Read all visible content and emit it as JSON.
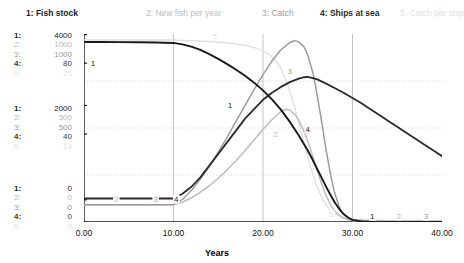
{
  "chart_data": {
    "type": "line",
    "title": "",
    "xlabel": "Years",
    "ylabel": "",
    "xlim": [
      0,
      40
    ],
    "grid": true,
    "legend_position": "top",
    "x_ticks": [
      "0.00",
      "10.00",
      "20.00",
      "30.00",
      "40.00"
    ],
    "x_tick_values": [
      0,
      10,
      20,
      30,
      40
    ],
    "axis_scales": [
      {
        "index": "1:",
        "series": "Fish stock",
        "color": "#222222",
        "top": "4000",
        "mid": "2000",
        "bottom": "0"
      },
      {
        "index": "2:",
        "series": "New fish per year",
        "color": "#b9b9b9",
        "top": "1000",
        "mid": "500",
        "bottom": "0"
      },
      {
        "index": "3:",
        "series": "Catch",
        "color": "#9a9a9a",
        "top": "1000",
        "mid": "500",
        "bottom": "0"
      },
      {
        "index": "4:",
        "series": "Ships at sea",
        "color": "#3c3c3c",
        "top": "80",
        "mid": "40",
        "bottom": "0"
      },
      {
        "index": "5:",
        "series": "Catch per ship",
        "color": "#e2e2e2",
        "top": "25",
        "mid": "14",
        "bottom": "0"
      }
    ],
    "legend": [
      {
        "label": "1: Fish stock",
        "color": "#1a1a1a"
      },
      {
        "label": "2: New fish per year",
        "color": "#bdbdbd"
      },
      {
        "label": "3: Catch",
        "color": "#9d9d9d"
      },
      {
        "label": "4: Ships at sea",
        "color": "#2b2b2b"
      },
      {
        "label": "5: Catch per ship",
        "color": "#e0e0e0"
      }
    ],
    "series": [
      {
        "name": "Fish stock",
        "tag": "1",
        "color": "#1a1a1a",
        "width": 1.9,
        "points": [
          [
            0,
            3830
          ],
          [
            2,
            3830
          ],
          [
            4,
            3828
          ],
          [
            6,
            3825
          ],
          [
            8,
            3820
          ],
          [
            10,
            3810
          ],
          [
            11,
            3780
          ],
          [
            12,
            3730
          ],
          [
            13,
            3660
          ],
          [
            14,
            3570
          ],
          [
            15,
            3470
          ],
          [
            16,
            3360
          ],
          [
            17,
            3240
          ],
          [
            18,
            3110
          ],
          [
            19,
            2965
          ],
          [
            20,
            2800
          ],
          [
            21,
            2610
          ],
          [
            22,
            2390
          ],
          [
            23,
            2130
          ],
          [
            24,
            1840
          ],
          [
            25,
            1520
          ],
          [
            25.5,
            1340
          ],
          [
            26,
            1150
          ],
          [
            26.5,
            960
          ],
          [
            27,
            770
          ],
          [
            27.5,
            590
          ],
          [
            28,
            420
          ],
          [
            28.5,
            280
          ],
          [
            29,
            170
          ],
          [
            29.5,
            95
          ],
          [
            30,
            45
          ],
          [
            31,
            12
          ],
          [
            32,
            5
          ],
          [
            34,
            3
          ],
          [
            36,
            2
          ],
          [
            38,
            2
          ],
          [
            40,
            2
          ]
        ]
      },
      {
        "name": "New fish per year",
        "tag": "2",
        "color": "#bdbdbd",
        "width": 1.5,
        "points": [
          [
            0,
            92
          ],
          [
            4,
            92
          ],
          [
            8,
            92
          ],
          [
            10,
            92
          ],
          [
            11,
            105
          ],
          [
            12,
            128
          ],
          [
            13,
            158
          ],
          [
            14,
            193
          ],
          [
            15,
            233
          ],
          [
            16,
            278
          ],
          [
            17,
            327
          ],
          [
            18,
            380
          ],
          [
            19,
            436
          ],
          [
            20,
            492
          ],
          [
            21,
            545
          ],
          [
            22,
            588
          ],
          [
            22.6,
            600
          ],
          [
            23,
            596
          ],
          [
            23.6,
            570
          ],
          [
            24,
            540
          ],
          [
            24.6,
            482
          ],
          [
            25,
            430
          ],
          [
            25.6,
            345
          ],
          [
            26,
            282
          ],
          [
            26.6,
            196
          ],
          [
            27,
            146
          ],
          [
            27.6,
            88
          ],
          [
            28,
            60
          ],
          [
            28.6,
            32
          ],
          [
            29,
            20
          ],
          [
            29.6,
            10
          ],
          [
            30,
            6
          ],
          [
            32,
            3
          ],
          [
            34,
            2
          ],
          [
            36,
            2
          ],
          [
            38,
            2
          ],
          [
            40,
            2
          ]
        ]
      },
      {
        "name": "Catch",
        "tag": "3",
        "color": "#9d9d9d",
        "width": 1.5,
        "points": [
          [
            0,
            92
          ],
          [
            4,
            92
          ],
          [
            8,
            92
          ],
          [
            10,
            92
          ],
          [
            11,
            120
          ],
          [
            12,
            168
          ],
          [
            13,
            228
          ],
          [
            14,
            296
          ],
          [
            15,
            372
          ],
          [
            16,
            452
          ],
          [
            17,
            536
          ],
          [
            18,
            620
          ],
          [
            19,
            704
          ],
          [
            20,
            784
          ],
          [
            21,
            856
          ],
          [
            22,
            916
          ],
          [
            23,
            955
          ],
          [
            23.6,
            965
          ],
          [
            24,
            958
          ],
          [
            24.6,
            930
          ],
          [
            25,
            888
          ],
          [
            25.6,
            790
          ],
          [
            26,
            690
          ],
          [
            26.6,
            520
          ],
          [
            27,
            395
          ],
          [
            27.6,
            240
          ],
          [
            28,
            155
          ],
          [
            28.6,
            72
          ],
          [
            29,
            42
          ],
          [
            29.6,
            18
          ],
          [
            30,
            10
          ],
          [
            32,
            4
          ],
          [
            34,
            3
          ],
          [
            36,
            2
          ],
          [
            38,
            2
          ],
          [
            40,
            2
          ]
        ]
      },
      {
        "name": "Ships at sea",
        "tag": "4",
        "color": "#2b2b2b",
        "width": 1.8,
        "points": [
          [
            0,
            10
          ],
          [
            4,
            10
          ],
          [
            8,
            10
          ],
          [
            10,
            10
          ],
          [
            11,
            12
          ],
          [
            12,
            15
          ],
          [
            13,
            19
          ],
          [
            14,
            24
          ],
          [
            15,
            29
          ],
          [
            16,
            34
          ],
          [
            17,
            39
          ],
          [
            18,
            44
          ],
          [
            19,
            48
          ],
          [
            20,
            52
          ],
          [
            21,
            55
          ],
          [
            22,
            57.5
          ],
          [
            23,
            59.5
          ],
          [
            24,
            61
          ],
          [
            24.6,
            61.6
          ],
          [
            25,
            61.8
          ],
          [
            26,
            60.8
          ],
          [
            27,
            59
          ],
          [
            28,
            57
          ],
          [
            29,
            55
          ],
          [
            30,
            52.8
          ],
          [
            31,
            50.5
          ],
          [
            32,
            48
          ],
          [
            33,
            45.5
          ],
          [
            34,
            43
          ],
          [
            35,
            40.5
          ],
          [
            36,
            38
          ],
          [
            37,
            35.5
          ],
          [
            38,
            33
          ],
          [
            39,
            30.5
          ],
          [
            40,
            28
          ]
        ]
      },
      {
        "name": "Catch per ship",
        "tag": "5",
        "color": "#e0e0e0",
        "width": 1.4,
        "points": [
          [
            0,
            24.2
          ],
          [
            5,
            24.2
          ],
          [
            10,
            24.2
          ],
          [
            12,
            24.1
          ],
          [
            14,
            24.0
          ],
          [
            16,
            23.8
          ],
          [
            18,
            23.5
          ],
          [
            19,
            23.2
          ],
          [
            20,
            22.8
          ],
          [
            21,
            22.0
          ],
          [
            21.6,
            21.2
          ],
          [
            22,
            20.4
          ],
          [
            22.6,
            18.8
          ],
          [
            23,
            17.4
          ],
          [
            23.6,
            15.0
          ],
          [
            24,
            13.2
          ],
          [
            24.6,
            10.4
          ],
          [
            25,
            8.6
          ],
          [
            25.6,
            6.2
          ],
          [
            26,
            4.8
          ],
          [
            26.6,
            3.2
          ],
          [
            27,
            2.4
          ],
          [
            27.6,
            1.5
          ],
          [
            28,
            1.1
          ],
          [
            29,
            0.6
          ],
          [
            30,
            0.4
          ],
          [
            32,
            0.3
          ],
          [
            34,
            0.2
          ],
          [
            36,
            0.2
          ],
          [
            38,
            0.2
          ],
          [
            40,
            0.2
          ]
        ]
      }
    ],
    "inline_tags": [
      {
        "text": "1",
        "series": "Fish stock",
        "x": 1.0,
        "y_frac": 0.845
      },
      {
        "text": "1",
        "series": "Fish stock",
        "x": 16.3,
        "y_frac": 0.62
      },
      {
        "text": "1",
        "series": "Fish stock",
        "x": 32.2,
        "y_frac": 0.028
      },
      {
        "text": "2",
        "series": "New fish per year",
        "x": 3.6,
        "y_frac": 0.118
      },
      {
        "text": "2",
        "series": "New fish per year",
        "x": 21.4,
        "y_frac": 0.468
      },
      {
        "text": "2",
        "series": "New fish per year",
        "x": 35.2,
        "y_frac": 0.028
      },
      {
        "text": "3",
        "series": "Catch",
        "x": 8.0,
        "y_frac": 0.118
      },
      {
        "text": "3",
        "series": "Catch",
        "x": 23.0,
        "y_frac": 0.8
      },
      {
        "text": "3",
        "series": "Catch",
        "x": 38.2,
        "y_frac": 0.028
      },
      {
        "text": "4",
        "series": "Ships at sea",
        "x": 10.3,
        "y_frac": 0.118
      },
      {
        "text": "4",
        "series": "Ships at sea",
        "x": 25.0,
        "y_frac": 0.492
      },
      {
        "text": "5",
        "series": "Catch per ship",
        "x": 14.6,
        "y_frac": 0.985
      },
      {
        "text": "5",
        "series": "Catch per ship",
        "x": 27.6,
        "y_frac": 0.038
      }
    ]
  }
}
